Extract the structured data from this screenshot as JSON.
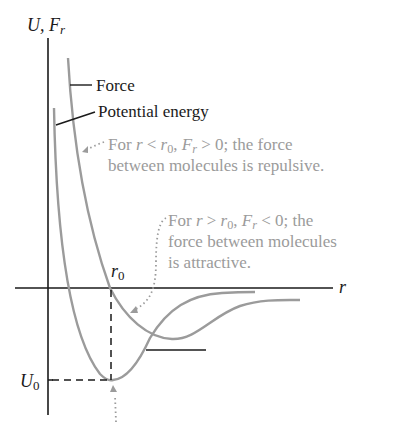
{
  "axes": {
    "y_label_U": "U,",
    "y_label_F": "F",
    "y_label_F_sub": "r",
    "x_label": "r"
  },
  "labels": {
    "force": "Force",
    "potential_energy": "Potential energy",
    "r0_main": "r",
    "r0_sub": "0",
    "U0_main": "U",
    "U0_sub": "0"
  },
  "annotations": {
    "repulsive": {
      "line1_prefix": "For ",
      "r": "r",
      "lt": " < ",
      "r0": "r",
      "r0_sub": "0",
      "comma": ", ",
      "F": "F",
      "F_sub": "r",
      "gt": " > 0; the force",
      "line2": "between molecules is repulsive."
    },
    "attractive": {
      "line1_prefix": "For ",
      "r": "r",
      "gt": " > ",
      "r0": "r",
      "r0_sub": "0",
      "comma": ", ",
      "F": "F",
      "F_sub": "r",
      "lt": " < 0; the",
      "line2": "force between molecules",
      "line3": "is attractive."
    }
  },
  "colors": {
    "axis": "#1a1a1a",
    "curve": "#9b9b9b",
    "annotation_text": "#9b9b9b"
  }
}
